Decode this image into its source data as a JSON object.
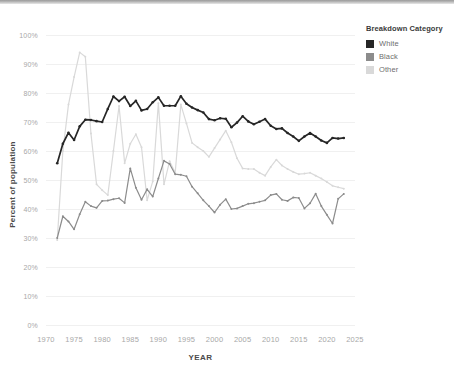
{
  "legend": {
    "title": "Breakdown Category",
    "position": "right",
    "items": [
      {
        "label": "White",
        "color": "#262626"
      },
      {
        "label": "Black",
        "color": "#8c8c8c"
      },
      {
        "label": "Other",
        "color": "#d9d9d9"
      }
    ]
  },
  "axes": {
    "y_ticks": [
      "100%",
      "90%",
      "80%",
      "70%",
      "60%",
      "50%",
      "40%",
      "30%",
      "20%",
      "10%",
      "0%"
    ],
    "x_ticks": [
      "1970",
      "1975",
      "1980",
      "1985",
      "1990",
      "1995",
      "2000",
      "2005",
      "2010",
      "2015",
      "2020",
      "2025"
    ],
    "y_title": "Percent of population",
    "x_title": "YEAR"
  },
  "chart_data": {
    "type": "line",
    "title": "",
    "xlabel": "YEAR",
    "ylabel": "Percent of population",
    "xlim": [
      1970,
      2025
    ],
    "ylim": [
      0,
      100
    ],
    "grid": true,
    "legend_title": "Breakdown Category",
    "legend_position": "right",
    "x": [
      1972,
      1973,
      1974,
      1975,
      1976,
      1977,
      1978,
      1979,
      1980,
      1981,
      1982,
      1983,
      1984,
      1985,
      1986,
      1987,
      1988,
      1989,
      1990,
      1991,
      1992,
      1993,
      1994,
      1995,
      1996,
      1997,
      1998,
      1999,
      2000,
      2001,
      2002,
      2003,
      2004,
      2005,
      2006,
      2007,
      2008,
      2009,
      2010,
      2011,
      2012,
      2013,
      2014,
      2015,
      2016,
      2017,
      2018,
      2019,
      2020,
      2021,
      2022,
      2023
    ],
    "series": [
      {
        "name": "White",
        "color": "#262626",
        "values": [
          55.8,
          62.5,
          66.3,
          63.8,
          68.5,
          70.8,
          70.7,
          70.3,
          70.0,
          74.5,
          78.8,
          77.2,
          78.7,
          75.5,
          77.3,
          74.0,
          74.5,
          76.8,
          78.5,
          75.6,
          75.6,
          75.6,
          78.9,
          76.3,
          75.0,
          74.1,
          73.3,
          71.0,
          70.6,
          71.3,
          71.1,
          68.2,
          69.8,
          72.0,
          70.2,
          69.2,
          70.1,
          71.0,
          68.7,
          67.6,
          67.8,
          66.2,
          65.0,
          63.5,
          65.0,
          66.2,
          65.0,
          63.6,
          62.8,
          64.5,
          64.3,
          64.5
        ]
      },
      {
        "name": "Black",
        "color": "#8c8c8c",
        "values": [
          30.0,
          37.5,
          35.7,
          33.0,
          38.2,
          42.5,
          41.0,
          40.4,
          42.8,
          42.9,
          43.4,
          43.7,
          42.1,
          54.0,
          47.3,
          43.2,
          46.8,
          44.3,
          50.5,
          56.6,
          55.5,
          52.0,
          51.8,
          51.3,
          47.7,
          45.4,
          43.0,
          41.0,
          38.8,
          41.5,
          43.4,
          40.0,
          40.2,
          41.0,
          41.8,
          42.0,
          42.5,
          43.0,
          44.8,
          45.2,
          43.2,
          42.8,
          44.0,
          43.8,
          40.2,
          42.0,
          45.3,
          41.0,
          38.0,
          35.0,
          43.5,
          45.2
        ]
      },
      {
        "name": "Other",
        "color": "#d9d9d9",
        "values": [
          29.3,
          60.0,
          76.0,
          85.5,
          94.0,
          92.5,
          66.0,
          48.5,
          46.5,
          44.8,
          60.0,
          75.5,
          55.8,
          62.5,
          65.8,
          61.3,
          43.0,
          49.5,
          76.5,
          48.5,
          56.5,
          52.5,
          76.0,
          69.5,
          62.8,
          61.3,
          60.0,
          58.0,
          61.0,
          64.0,
          67.0,
          63.0,
          57.5,
          54.0,
          53.8,
          53.8,
          52.5,
          51.5,
          54.5,
          57.0,
          55.0,
          53.8,
          52.8,
          52.0,
          52.2,
          52.5,
          51.5,
          50.5,
          49.3,
          48.0,
          47.5,
          47.0
        ]
      }
    ]
  }
}
